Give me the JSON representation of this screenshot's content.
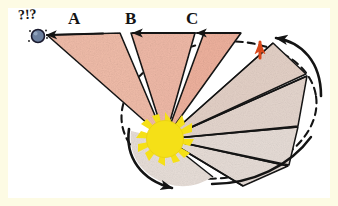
{
  "figure": {
    "kind": "hand-drawn astronomy diagram",
    "frame_color": "#fdfbe4",
    "canvas_color": "#ffffff"
  },
  "labels": {
    "sector_a": "A",
    "sector_b": "B",
    "sector_c": "C",
    "observer_exclamation": "?!?"
  },
  "colors": {
    "sector_near_fill": "#f0b7a4",
    "sector_mid_fill": "#efc9bb",
    "sector_far_fill": "#e8d8d0",
    "sector_pale_fill": "#e6dcd6",
    "sun_fill": "#f5e017",
    "sun_ray": "#f5e017",
    "observer_fill": "#6b7f9e",
    "observer_stroke": "#1a1a2e",
    "ink": "#141414",
    "orange_arrow": "#d9481a",
    "orbit_dash": "#141414",
    "orbit_solid": "#141414"
  },
  "sun": {
    "name": "sun",
    "cx": 165,
    "cy": 139,
    "r": 19,
    "ray_count": 18
  },
  "observer": {
    "name": "observer-body",
    "cx": 38,
    "cy": 36,
    "r": 6
  },
  "sectors": [
    {
      "id": "A",
      "fill_key": "sector_near_fill",
      "label": "A"
    },
    {
      "id": "B",
      "fill_key": "sector_mid_fill",
      "label": "B"
    },
    {
      "id": "C",
      "fill_key": "sector_mid_fill",
      "label": "C"
    },
    {
      "id": "D",
      "fill_key": "sector_far_fill",
      "label": ""
    },
    {
      "id": "E",
      "fill_key": "sector_far_fill",
      "label": ""
    },
    {
      "id": "F",
      "fill_key": "sector_pale_fill",
      "label": ""
    },
    {
      "id": "G",
      "fill_key": "sector_pale_fill",
      "label": ""
    }
  ],
  "arrows": {
    "sector_a_direction": "left",
    "sector_b_direction": "left",
    "sector_c_direction": "left",
    "orbit_top_direction": "counterclockwise",
    "orbit_bottom_direction": "clockwise-right",
    "orange_marker_direction": "up"
  },
  "orbit": {
    "name": "elliptical-orbit",
    "style": "dashed with solid arc segments",
    "cx": 219,
    "cy": 110,
    "rx": 98,
    "ry": 68,
    "rotation_deg": -8
  }
}
